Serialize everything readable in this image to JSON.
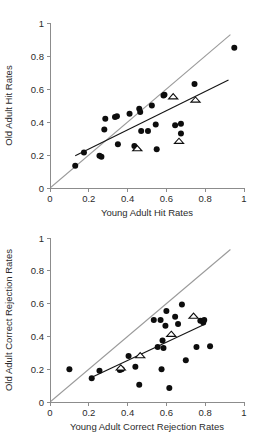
{
  "figure": {
    "background_color": "#ffffff",
    "panel_count": 2
  },
  "chart_data": [
    {
      "type": "scatter",
      "panel_id": "top",
      "title": "",
      "xlabel": "Young Adult Hit Rates",
      "ylabel": "Old Adult Hit Rates",
      "xlim": [
        0,
        1
      ],
      "ylim": [
        0,
        1
      ],
      "xticks": [
        0,
        0.2,
        0.4,
        0.6,
        0.8,
        1
      ],
      "yticks": [
        0,
        0.2,
        0.4,
        0.6,
        0.8,
        1
      ],
      "xticklabels": [
        "0",
        "0.2",
        "0.4",
        "0.6",
        "0.8",
        "1"
      ],
      "yticklabels": [
        "0",
        "0.2",
        "0.4",
        "0.6",
        "0.8",
        "1"
      ],
      "grid": false,
      "legend": null,
      "series": [
        {
          "name": "Individual studies",
          "marker": "filled-circle",
          "color": "#0d0d0d",
          "points": [
            [
              0.13,
              0.135
            ],
            [
              0.175,
              0.215
            ],
            [
              0.255,
              0.195
            ],
            [
              0.265,
              0.19
            ],
            [
              0.28,
              0.355
            ],
            [
              0.285,
              0.42
            ],
            [
              0.335,
              0.43
            ],
            [
              0.345,
              0.435
            ],
            [
              0.35,
              0.265
            ],
            [
              0.41,
              0.45
            ],
            [
              0.435,
              0.255
            ],
            [
              0.46,
              0.48
            ],
            [
              0.465,
              0.46
            ],
            [
              0.47,
              0.345
            ],
            [
              0.505,
              0.345
            ],
            [
              0.525,
              0.5
            ],
            [
              0.545,
              0.385
            ],
            [
              0.55,
              0.235
            ],
            [
              0.585,
              0.56
            ],
            [
              0.59,
              0.565
            ],
            [
              0.645,
              0.38
            ],
            [
              0.675,
              0.39
            ],
            [
              0.675,
              0.33
            ],
            [
              0.745,
              0.63
            ],
            [
              0.95,
              0.85
            ]
          ]
        },
        {
          "name": "Averages",
          "marker": "open-triangle",
          "color": "#0d0d0d",
          "points": [
            [
              0.45,
              0.24
            ],
            [
              0.635,
              0.555
            ],
            [
              0.665,
              0.285
            ],
            [
              0.75,
              0.535
            ]
          ]
        }
      ],
      "lines": [
        {
          "name": "identity-line",
          "style": "gray-solid",
          "color": "#9a9a9a",
          "from": [
            0,
            0
          ],
          "to": [
            0.93,
            0.93
          ]
        },
        {
          "name": "regression-line",
          "style": "black-solid",
          "color": "#141414",
          "from": [
            0.13,
            0.195
          ],
          "to": [
            0.92,
            0.655
          ]
        }
      ]
    },
    {
      "type": "scatter",
      "panel_id": "bottom",
      "title": "",
      "xlabel": "Young Adult Correct Rejection Rates",
      "ylabel": "Old Adult Correct Rejection Rates",
      "xlim": [
        0,
        1
      ],
      "ylim": [
        0,
        1
      ],
      "xticks": [
        0,
        0.2,
        0.4,
        0.6,
        0.8,
        1
      ],
      "yticks": [
        0,
        0.2,
        0.4,
        0.6,
        0.8,
        1
      ],
      "xticklabels": [
        "0",
        "0.2",
        "0.4",
        "0.6",
        "0.8",
        "1"
      ],
      "yticklabels": [
        "0",
        "0.2",
        "0.4",
        "0.6",
        "0.8",
        "1"
      ],
      "grid": false,
      "legend": null,
      "series": [
        {
          "name": "Individual studies",
          "marker": "filled-circle",
          "color": "#0d0d0d",
          "points": [
            [
              0.1,
              0.2
            ],
            [
              0.215,
              0.145
            ],
            [
              0.255,
              0.19
            ],
            [
              0.36,
              0.195
            ],
            [
              0.37,
              0.2
            ],
            [
              0.405,
              0.28
            ],
            [
              0.44,
              0.215
            ],
            [
              0.46,
              0.105
            ],
            [
              0.535,
              0.5
            ],
            [
              0.555,
              0.335
            ],
            [
              0.57,
              0.5
            ],
            [
              0.575,
              0.2
            ],
            [
              0.58,
              0.375
            ],
            [
              0.585,
              0.33
            ],
            [
              0.595,
              0.465
            ],
            [
              0.6,
              0.555
            ],
            [
              0.615,
              0.085
            ],
            [
              0.645,
              0.52
            ],
            [
              0.66,
              0.475
            ],
            [
              0.68,
              0.595
            ],
            [
              0.7,
              0.255
            ],
            [
              0.755,
              0.335
            ],
            [
              0.775,
              0.495
            ],
            [
              0.79,
              0.485
            ],
            [
              0.795,
              0.5
            ],
            [
              0.825,
              0.34
            ]
          ]
        },
        {
          "name": "Averages",
          "marker": "open-triangle",
          "color": "#0d0d0d",
          "points": [
            [
              0.365,
              0.21
            ],
            [
              0.465,
              0.285
            ],
            [
              0.625,
              0.415
            ],
            [
              0.74,
              0.525
            ]
          ]
        }
      ],
      "lines": [
        {
          "name": "identity-line",
          "style": "gray-solid",
          "color": "#9a9a9a",
          "from": [
            0,
            0
          ],
          "to": [
            0.93,
            0.93
          ]
        },
        {
          "name": "regression-line",
          "style": "black-solid",
          "color": "#141414",
          "from": [
            0.205,
            0.145
          ],
          "to": [
            0.8,
            0.475
          ]
        }
      ]
    }
  ]
}
